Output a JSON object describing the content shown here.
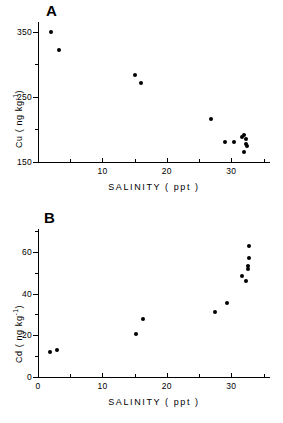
{
  "figure": {
    "background": "#ffffff",
    "marker_color": "#000000",
    "axis_color": "#000000"
  },
  "panels": [
    {
      "id": "A",
      "label": "A",
      "chart_ref": 0
    },
    {
      "id": "B",
      "label": "B",
      "chart_ref": 1
    }
  ],
  "chart_data": [
    {
      "type": "scatter",
      "title": "A",
      "xlabel": "SALINITY ( ppt )",
      "ylabel": "Cu ( ng kg",
      "ylabel_sup": "-1",
      "ylabel_tail": ")",
      "ylabel_quantity": "Cu",
      "ylabel_unit": "ng kg-1",
      "xlim": [
        0,
        36
      ],
      "ylim": [
        150,
        365
      ],
      "grid": false,
      "legend": "none",
      "xticks_major": [
        10,
        20,
        30
      ],
      "xticklabels_major": [
        "10",
        "20",
        "30"
      ],
      "xticks_minor": [
        5,
        15,
        25,
        35
      ],
      "yticks_major": [
        150,
        250,
        350
      ],
      "yticklabels_major": [
        "150",
        "250",
        "350"
      ],
      "yticks_minor": [
        200,
        300
      ],
      "x": [
        2.0,
        3.2,
        15.0,
        16.0,
        26.9,
        29.0,
        30.4,
        31.7,
        32.0,
        32.2,
        32.3,
        32.4,
        32.0
      ],
      "y": [
        350,
        322,
        283,
        272,
        216,
        180,
        180,
        189,
        192,
        186,
        178,
        174,
        165
      ],
      "n_points": 13
    },
    {
      "type": "scatter",
      "title": "B",
      "xlabel": "SALINITY ( ppt )",
      "ylabel": "Cd ( ng kg",
      "ylabel_sup": "-1",
      "ylabel_tail": ")",
      "ylabel_quantity": "Cd",
      "ylabel_unit": "ng kg-1",
      "xlim": [
        0,
        36
      ],
      "ylim": [
        0,
        71
      ],
      "grid": false,
      "legend": "none",
      "xticks_major": [
        0,
        10,
        20,
        30
      ],
      "xticklabels_major": [
        "0",
        "10",
        "20",
        "30"
      ],
      "xticks_minor": [
        5,
        15,
        25,
        35
      ],
      "yticks_major": [
        0,
        20,
        40,
        60
      ],
      "yticklabels_major": [
        "0",
        "20",
        "40",
        "60"
      ],
      "yticks_minor": [
        10,
        30,
        50,
        70
      ],
      "x": [
        1.9,
        3.0,
        15.2,
        16.3,
        27.4,
        29.4,
        31.6,
        32.3,
        32.6,
        32.6,
        32.7,
        32.8
      ],
      "y": [
        11.8,
        12.8,
        20.6,
        27.6,
        31.4,
        35.4,
        48.4,
        46.2,
        52.0,
        53.2,
        57.2,
        63.0
      ],
      "n_points": 12
    }
  ]
}
